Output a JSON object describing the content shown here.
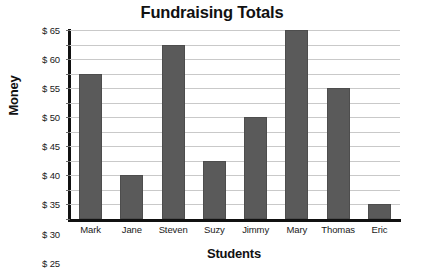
{
  "chart_data": {
    "type": "bar",
    "title": "Fundraising Totals",
    "xlabel": "Students",
    "ylabel": "Money",
    "categories": [
      "Mark",
      "Jane",
      "Steven",
      "Suzy",
      "Jimmy",
      "Mary",
      "Thomas",
      "Eric"
    ],
    "values": [
      50,
      15,
      60,
      20,
      35,
      65,
      45,
      5
    ],
    "ylim": [
      0,
      65
    ],
    "ytick_values": [
      0,
      5,
      10,
      15,
      20,
      25,
      30,
      35,
      40,
      45,
      50,
      55,
      60,
      65
    ],
    "ytick_labels": [
      "0",
      "$ 5",
      "$ 10",
      "$ 15",
      "$ 20",
      "$ 25",
      "$ 30",
      "$ 35",
      "$ 40",
      "$ 45",
      "$ 50",
      "$ 55",
      "$ 60",
      "$ 65"
    ],
    "grid": true,
    "legend": false,
    "bar_color": "#5a5a5a",
    "gridline_color": "#c9c9c9",
    "axis_color": "#111111",
    "background": "#ffffff"
  }
}
